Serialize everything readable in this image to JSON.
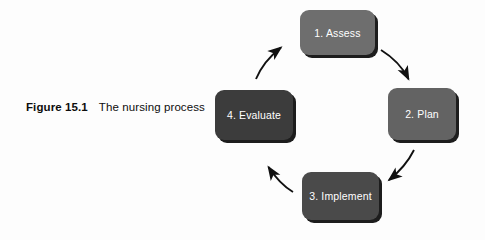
{
  "figure": {
    "caption_label": "Figure 15.1",
    "caption_text": "The nursing process",
    "background_color": "#fdfdfd",
    "caption_color": "#0d0d0d"
  },
  "diagram": {
    "type": "cycle",
    "node_text_color": "#ffffff",
    "arrow_color": "#111111",
    "shadow_color": "#1d1d1d",
    "nodes": [
      {
        "label": "1. Assess",
        "color": "#6e6e6e"
      },
      {
        "label": "2. Plan",
        "color": "#636363"
      },
      {
        "label": "3. Implement",
        "color": "#4a4a4a"
      },
      {
        "label": "4. Evaluate",
        "color": "#3c3c3c"
      }
    ],
    "arrows": [
      {
        "from": "1. Assess",
        "to": "2. Plan",
        "direction": "down-right"
      },
      {
        "from": "2. Plan",
        "to": "3. Implement",
        "direction": "down-left"
      },
      {
        "from": "3. Implement",
        "to": "4. Evaluate",
        "direction": "up-left"
      },
      {
        "from": "4. Evaluate",
        "to": "1. Assess",
        "direction": "up-right"
      }
    ]
  }
}
